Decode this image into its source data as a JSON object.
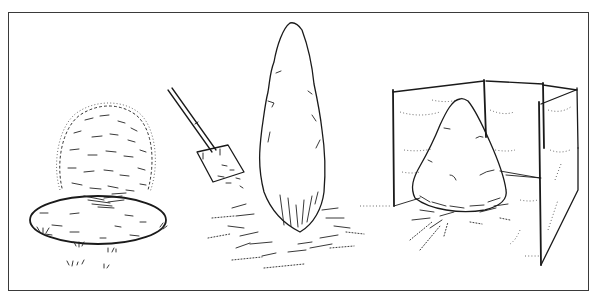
{
  "figure": {
    "panels": [
      {
        "id": "panel-mulch-circle",
        "subject": "rounded shrub with mulched circular bed"
      },
      {
        "id": "panel-columnar-mulch",
        "subject": "columnar conifer with shovel spreading mulch"
      },
      {
        "id": "panel-windscreen",
        "subject": "conical shrub protected by burlap windscreen on stakes"
      }
    ],
    "colors": {
      "ink": "#1a1a1a",
      "frame": "#3a3a3a",
      "background": "#ffffff"
    }
  }
}
